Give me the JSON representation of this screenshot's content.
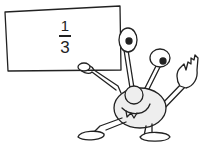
{
  "illustration": {
    "subject": "cartoon alien holding a sign",
    "sign": {
      "numerator": "1",
      "denominator": "3"
    },
    "colors": {
      "line": "#222222",
      "fill": "#ffffff",
      "shade": "#e8e8e8"
    }
  }
}
